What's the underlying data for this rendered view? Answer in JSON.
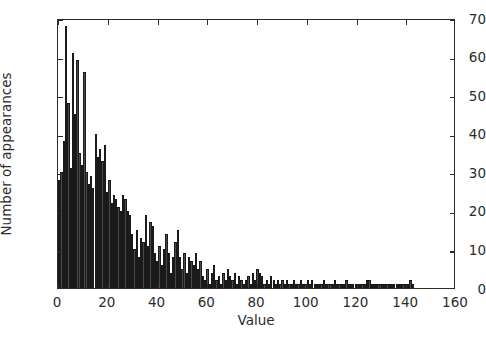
{
  "chart_data": {
    "type": "bar",
    "title": "",
    "subtitle": "",
    "xlabel": "Value",
    "ylabel": "Number of appearances",
    "xlim": [
      0,
      160
    ],
    "ylim": [
      0,
      70
    ],
    "xticks": [
      0,
      20,
      40,
      60,
      80,
      100,
      120,
      140,
      160
    ],
    "yticks": [
      0,
      10,
      20,
      30,
      40,
      50,
      60,
      70
    ],
    "grid": false,
    "legend": null,
    "bar_color": "#4a4a4a",
    "edge_color": "#1a1a1a",
    "bin_width": 0.92,
    "annotations": [],
    "x": [
      0.5,
      1.4,
      2.3,
      3.2,
      4.2,
      5.1,
      6.0,
      6.9,
      7.8,
      8.7,
      9.7,
      10.6,
      11.5,
      12.4,
      13.3,
      14.2,
      15.2,
      16.1,
      17.0,
      17.9,
      18.8,
      19.7,
      20.7,
      21.6,
      22.5,
      23.4,
      24.3,
      25.2,
      26.2,
      27.1,
      28.0,
      28.9,
      29.8,
      30.7,
      31.7,
      32.6,
      33.5,
      34.4,
      35.3,
      36.2,
      37.2,
      38.1,
      39.0,
      39.9,
      40.8,
      41.7,
      42.7,
      43.6,
      44.5,
      45.4,
      46.3,
      47.2,
      48.2,
      49.1,
      50.0,
      50.9,
      51.8,
      52.7,
      53.7,
      54.6,
      55.5,
      56.4,
      57.3,
      58.2,
      59.2,
      60.1,
      61.0,
      61.9,
      62.8,
      63.7,
      64.7,
      65.6,
      66.5,
      67.4,
      68.3,
      69.2,
      70.2,
      71.1,
      72.0,
      72.9,
      73.8,
      74.7,
      75.7,
      76.6,
      77.5,
      78.4,
      79.3,
      80.2,
      81.2,
      82.1,
      83.0,
      83.9,
      84.8,
      85.7,
      86.7,
      87.6,
      88.5,
      89.4,
      90.3,
      91.2,
      92.2,
      93.1,
      94.0,
      94.9,
      95.8,
      96.7,
      97.7,
      98.6,
      99.5,
      100.4,
      101.3,
      102.2,
      103.2,
      104.1,
      105.0,
      105.9,
      106.8,
      107.7,
      108.7,
      109.6,
      110.5,
      111.4,
      112.3,
      113.2,
      114.2,
      115.1,
      116.0,
      116.9,
      117.8,
      118.7,
      119.7,
      120.6,
      121.5,
      122.4,
      123.3,
      124.2,
      125.2,
      126.1,
      127.0,
      127.9,
      128.8,
      129.7,
      130.7,
      131.6,
      132.5,
      133.4,
      134.3,
      135.2,
      136.2,
      137.1,
      138.0,
      138.9,
      139.8,
      140.7,
      141.7,
      142.6
    ],
    "values": [
      28,
      30,
      38,
      68,
      48,
      31,
      61,
      45,
      59,
      35,
      32,
      56,
      30,
      27,
      29,
      26,
      40,
      34,
      36,
      33,
      37,
      25,
      28,
      22,
      24,
      23,
      21,
      20,
      24,
      23,
      20,
      19,
      14,
      10,
      15,
      8,
      13,
      12,
      19,
      11,
      17,
      16,
      9,
      7,
      11,
      6,
      10,
      14,
      9,
      4,
      8,
      12,
      15,
      8,
      5,
      9,
      4,
      8,
      7,
      6,
      9,
      5,
      7,
      3,
      2,
      5,
      1,
      4,
      6,
      2,
      3,
      1,
      4,
      2,
      5,
      3,
      2,
      4,
      1,
      3,
      2,
      1,
      2,
      3,
      1,
      4,
      2,
      5,
      4,
      3,
      1,
      2,
      1,
      3,
      2,
      1,
      2,
      1,
      2,
      1,
      2,
      1,
      1,
      2,
      1,
      1,
      2,
      1,
      1,
      2,
      1,
      2,
      1,
      1,
      1,
      1,
      2,
      1,
      1,
      1,
      1,
      2,
      1,
      1,
      1,
      1,
      2,
      1,
      1,
      1,
      1,
      1,
      1,
      1,
      1,
      2,
      2,
      1,
      1,
      1,
      1,
      1,
      1,
      1,
      1,
      1,
      1,
      1,
      1,
      1,
      1,
      1,
      1,
      1,
      2,
      1
    ]
  }
}
